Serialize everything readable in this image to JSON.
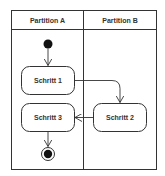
{
  "diagram": {
    "type": "uml-activity-diagram",
    "partitions": [
      {
        "id": "A",
        "label": "Partition A"
      },
      {
        "id": "B",
        "label": "Partition B"
      }
    ],
    "nodes": [
      {
        "id": "start",
        "kind": "initial-node",
        "partition": "A"
      },
      {
        "id": "s1",
        "kind": "action",
        "label": "Schritt 1",
        "partition": "A"
      },
      {
        "id": "s2",
        "kind": "action",
        "label": "Schritt 2",
        "partition": "B"
      },
      {
        "id": "s3",
        "kind": "action",
        "label": "Schritt 3",
        "partition": "A"
      },
      {
        "id": "end",
        "kind": "final-node",
        "partition": "A"
      }
    ],
    "edges": [
      {
        "from": "start",
        "to": "s1"
      },
      {
        "from": "s1",
        "to": "s2"
      },
      {
        "from": "s2",
        "to": "s3"
      },
      {
        "from": "s3",
        "to": "end"
      }
    ],
    "colors": {
      "line": "#333333",
      "fill": "#ffffff",
      "node_fill": "#111111"
    }
  }
}
